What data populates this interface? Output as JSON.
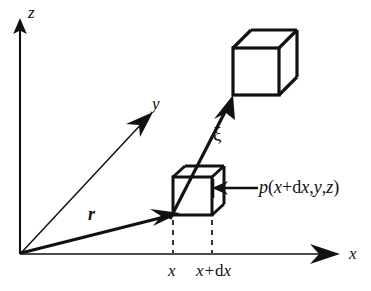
{
  "figure": {
    "background_color": "#ffffff",
    "line_color": "#111111"
  },
  "axes": {
    "z_label": "z",
    "y_label": "y",
    "x_label": "x",
    "origin_label": ""
  },
  "vectors": {
    "position_vector_label": "r",
    "displacement_vector_label": "ξ"
  },
  "ticks": {
    "first": "x",
    "second_prefix": "x+",
    "second_d": "d",
    "second_suffix": "x"
  },
  "annotations": {
    "pressure_label_p": "p",
    "pressure_label_open": "(",
    "pressure_label_x": "x",
    "pressure_label_plus": "+",
    "pressure_label_d": "d",
    "pressure_label_dx": "x",
    "pressure_label_comma1": ",",
    "pressure_label_y": "y",
    "pressure_label_comma2": ",",
    "pressure_label_z": "z",
    "pressure_label_close": ")",
    "pressure_label_full": "p(x+dx,y,z)"
  },
  "shapes": {
    "small_cube_name": "differential-element-cube",
    "large_cube_name": "displaced-element-cube"
  }
}
